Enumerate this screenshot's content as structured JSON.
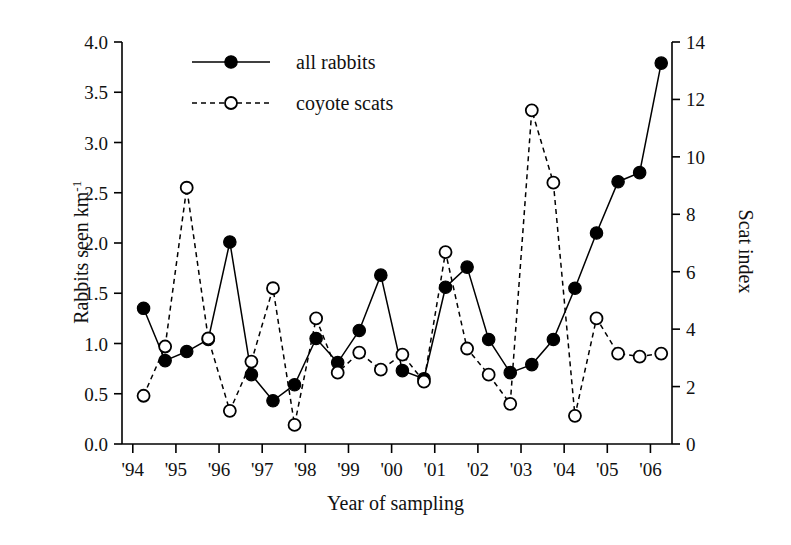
{
  "chart_data": {
    "type": "line",
    "title": "",
    "xlabel": "Year of sampling",
    "ylabel": "Rabbits seen km-1",
    "ylabel_main": "Rabbits seen km",
    "ylabel_exponent": "-1",
    "ylabel_right": "Scat index",
    "grid": false,
    "legend_position": "top-center",
    "xlim": [
      1993.75,
      2006.5
    ],
    "ylim": [
      0.0,
      4.0
    ],
    "ylim_right": [
      0,
      14
    ],
    "xticks": [
      "'94",
      "'95",
      "'96",
      "'97",
      "'98",
      "'99",
      "'00",
      "'01",
      "'02",
      "'03",
      "'04",
      "'05",
      "'06"
    ],
    "xtick_values": [
      1994,
      1995,
      1996,
      1997,
      1998,
      1999,
      2000,
      2001,
      2002,
      2003,
      2004,
      2005,
      2006
    ],
    "yticks_left": [
      "0.0",
      "0.5",
      "1.0",
      "1.5",
      "2.0",
      "2.5",
      "3.0",
      "3.5",
      "4.0"
    ],
    "ytick_values_left": [
      0.0,
      0.5,
      1.0,
      1.5,
      2.0,
      2.5,
      3.0,
      3.5,
      4.0
    ],
    "yticks_right": [
      "0",
      "2",
      "4",
      "6",
      "8",
      "10",
      "12",
      "14"
    ],
    "ytick_values_right": [
      0,
      2,
      4,
      6,
      8,
      10,
      12,
      14
    ],
    "series": [
      {
        "name": "all rabbits",
        "axis": "left",
        "marker": "filled-circle",
        "line": "solid",
        "color": "#000000",
        "x": [
          1994.25,
          1994.75,
          1995.25,
          1995.75,
          1996.25,
          1996.75,
          1997.25,
          1997.75,
          1998.25,
          1998.75,
          1999.25,
          1999.75,
          2000.25,
          2000.75,
          2001.25,
          2001.75,
          2002.25,
          2002.75,
          2003.25,
          2003.75,
          2004.25,
          2004.75,
          2005.25,
          2005.75,
          2006.25
        ],
        "y": [
          1.35,
          0.83,
          0.92,
          1.04,
          2.01,
          0.69,
          0.43,
          0.59,
          1.05,
          0.81,
          1.13,
          1.68,
          0.73,
          0.65,
          1.56,
          1.76,
          1.04,
          0.71,
          0.79,
          1.04,
          1.55,
          2.1,
          2.61,
          2.7,
          3.79
        ]
      },
      {
        "name": "coyote scats",
        "axis": "right",
        "marker": "open-circle",
        "line": "dashed",
        "color": "#000000",
        "x": [
          1994.25,
          1994.75,
          1995.25,
          1995.75,
          1996.25,
          1996.75,
          1997.25,
          1997.75,
          1998.25,
          1998.75,
          1999.25,
          1999.75,
          2000.25,
          2000.75,
          2001.25,
          2001.75,
          2002.25,
          2002.75,
          2003.25,
          2003.75,
          2004.25,
          2004.75,
          2005.25,
          2005.75,
          2006.25
        ],
        "y_left_equiv": [
          0.48,
          0.97,
          2.55,
          1.05,
          0.33,
          0.82,
          1.55,
          0.19,
          1.25,
          0.71,
          0.91,
          0.74,
          0.89,
          0.62,
          1.91,
          0.95,
          0.69,
          0.4,
          3.32,
          2.6,
          0.28,
          1.25,
          0.9,
          0.87,
          0.9
        ],
        "y": [
          1.68,
          3.4,
          8.93,
          3.68,
          1.16,
          2.87,
          5.43,
          0.67,
          4.38,
          2.49,
          3.19,
          2.59,
          3.12,
          2.17,
          6.69,
          3.33,
          2.42,
          1.4,
          11.62,
          9.1,
          0.98,
          4.38,
          3.15,
          3.05,
          3.15
        ]
      }
    ]
  },
  "legend": {
    "items": [
      {
        "label": "all rabbits",
        "marker": "filled-circle",
        "line": "solid"
      },
      {
        "label": "coyote scats",
        "marker": "open-circle",
        "line": "dashed"
      }
    ]
  },
  "axis_titles": {
    "left_main": "Rabbits seen km",
    "left_exponent": "-1",
    "right": "Scat index",
    "bottom": "Year of sampling"
  }
}
